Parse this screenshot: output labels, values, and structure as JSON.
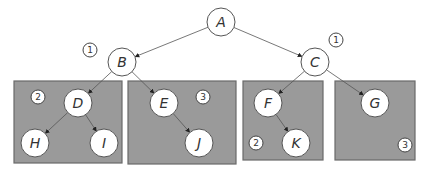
{
  "diagram": {
    "type": "tree",
    "nodes": [
      {
        "id": "A",
        "label": "A",
        "group": null
      },
      {
        "id": "B",
        "label": "B",
        "group": null
      },
      {
        "id": "C",
        "label": "C",
        "group": null
      },
      {
        "id": "D",
        "label": "D",
        "group": "box-1"
      },
      {
        "id": "E",
        "label": "E",
        "group": "box-2"
      },
      {
        "id": "F",
        "label": "F",
        "group": "box-3"
      },
      {
        "id": "G",
        "label": "G",
        "group": "box-4"
      },
      {
        "id": "H",
        "label": "H",
        "group": "box-1"
      },
      {
        "id": "I",
        "label": "I",
        "group": "box-1"
      },
      {
        "id": "J",
        "label": "J",
        "group": "box-2"
      },
      {
        "id": "K",
        "label": "K",
        "group": "box-3"
      }
    ],
    "edges": [
      {
        "from": "A",
        "to": "B"
      },
      {
        "from": "A",
        "to": "C"
      },
      {
        "from": "B",
        "to": "D"
      },
      {
        "from": "B",
        "to": "E"
      },
      {
        "from": "C",
        "to": "F"
      },
      {
        "from": "C",
        "to": "G"
      },
      {
        "from": "D",
        "to": "H"
      },
      {
        "from": "D",
        "to": "I"
      },
      {
        "from": "E",
        "to": "J"
      },
      {
        "from": "F",
        "to": "K"
      }
    ],
    "groups": [
      "box-1",
      "box-2",
      "box-3",
      "box-4"
    ],
    "badges": [
      {
        "id": "badge-b",
        "label": "1",
        "near": "B"
      },
      {
        "id": "badge-c",
        "label": "1",
        "near": "C"
      },
      {
        "id": "badge-box1",
        "label": "2",
        "near": "box-1"
      },
      {
        "id": "badge-box2",
        "label": "3",
        "near": "box-2"
      },
      {
        "id": "badge-box3",
        "label": "2",
        "near": "box-3"
      },
      {
        "id": "badge-box4",
        "label": "3",
        "near": "box-4"
      }
    ],
    "colors": {
      "box_fill": "#9a9a9a",
      "node_fill": "#ffffff",
      "edge": "#555555"
    }
  }
}
